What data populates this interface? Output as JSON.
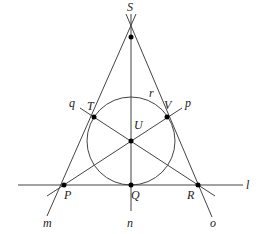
{
  "diagram": {
    "points": {
      "S": {
        "label": "S",
        "x": 131,
        "y": 37
      },
      "T": {
        "label": "T",
        "x": 94,
        "y": 117
      },
      "V": {
        "label": "V",
        "x": 167,
        "y": 117
      },
      "U": {
        "label": "U",
        "x": 131,
        "y": 141
      },
      "P": {
        "label": "P",
        "x": 64,
        "y": 185
      },
      "Q": {
        "label": "Q",
        "x": 131,
        "y": 185
      },
      "R": {
        "label": "R",
        "x": 198,
        "y": 185
      }
    },
    "circle": {
      "label": "r",
      "cx": 131,
      "cy": 141,
      "r": 44
    },
    "lines": {
      "l": {
        "label": "l"
      },
      "m": {
        "label": "m"
      },
      "n": {
        "label": "n"
      },
      "o": {
        "label": "o"
      },
      "p": {
        "label": "p"
      },
      "q": {
        "label": "q"
      }
    }
  }
}
